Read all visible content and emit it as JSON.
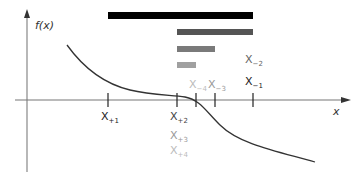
{
  "axes": {
    "y_label": "f(x)",
    "x_label": "x"
  },
  "colors": {
    "bar_1": "#000000",
    "bar_2": "#555555",
    "bar_3": "#7a7a7a",
    "bar_4": "#a0a0a0",
    "axis": "#777777",
    "curve": "#333333",
    "label_dark": "#222222",
    "label_mid": "#666666",
    "label_light": "#aaaaaa"
  },
  "bars": [
    {
      "x1": 108,
      "x2": 253,
      "y": 12,
      "color": "#000000"
    },
    {
      "x1": 177,
      "x2": 253,
      "y": 29,
      "color": "#555555"
    },
    {
      "x1": 177,
      "x2": 215,
      "y": 46,
      "color": "#7a7a7a"
    },
    {
      "x1": 177,
      "x2": 196,
      "y": 62,
      "color": "#a0a0a0"
    }
  ],
  "ticks": [
    108,
    177,
    196,
    215,
    253
  ],
  "labels": {
    "x_plus1": {
      "base": "X",
      "sub": "+1"
    },
    "x_plus2": {
      "base": "X",
      "sub": "+2"
    },
    "x_plus3": {
      "base": "X",
      "sub": "+3"
    },
    "x_plus4": {
      "base": "X",
      "sub": "+4"
    },
    "x_minus1": {
      "base": "X",
      "sub": "−1"
    },
    "x_minus2": {
      "base": "X",
      "sub": "−2"
    },
    "x_minus3": {
      "base": "X",
      "sub": "−3"
    },
    "x_minus4": {
      "base": "X",
      "sub": "−4"
    }
  }
}
